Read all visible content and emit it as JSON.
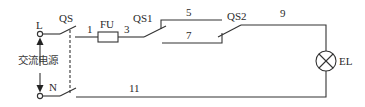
{
  "diagram": {
    "type": "electrical-schematic",
    "colors": {
      "line": "#333333",
      "background": "#ffffff"
    },
    "source": {
      "label": "交流电源",
      "terminal_L": "L",
      "terminal_N": "N"
    },
    "components": {
      "main_switch": {
        "label": "QS"
      },
      "fuse": {
        "label": "FU"
      },
      "switch_1": {
        "label": "QS1"
      },
      "switch_2": {
        "label": "QS2"
      },
      "lamp": {
        "label": "EL"
      }
    },
    "wires": {
      "w1": "1",
      "w3": "3",
      "w5": "5",
      "w7": "7",
      "w9": "9",
      "w11": "11"
    }
  }
}
